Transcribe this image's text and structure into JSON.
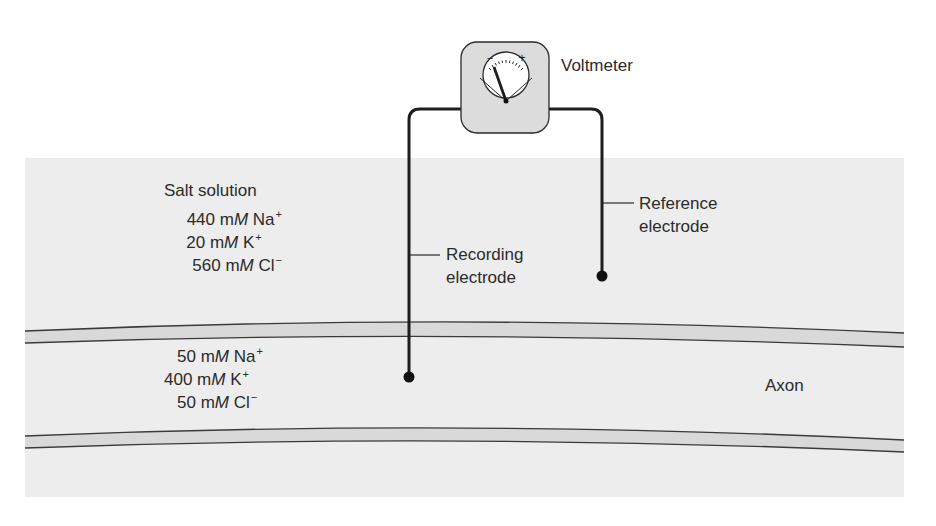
{
  "diagram": {
    "type": "experimental-setup",
    "colors": {
      "solution_bg": "#ededed",
      "membrane_fill": "#d9d9d9",
      "line": "#2a2a2a",
      "voltmeter_box": "#dcdcdc",
      "dial_face": "#ffffff"
    },
    "voltmeter": {
      "label": "Voltmeter",
      "minus_sign": "−",
      "plus_sign": "+"
    },
    "electrodes": {
      "recording": {
        "label_line1": "Recording",
        "label_line2": "electrode"
      },
      "reference": {
        "label_line1": "Reference",
        "label_line2": "electrode"
      }
    },
    "outside": {
      "title": "Salt solution",
      "ions": [
        {
          "conc": "440",
          "unit_m": "m",
          "unit_M": "M",
          "ion": "Na",
          "charge": "+"
        },
        {
          "conc": "20",
          "unit_m": "m",
          "unit_M": "M",
          "ion": "K",
          "charge": "+"
        },
        {
          "conc": "560",
          "unit_m": "m",
          "unit_M": "M",
          "ion": "Cl",
          "charge": "−"
        }
      ]
    },
    "inside": {
      "ions": [
        {
          "conc": "50",
          "unit_m": "m",
          "unit_M": "M",
          "ion": "Na",
          "charge": "+"
        },
        {
          "conc": "400",
          "unit_m": "m",
          "unit_M": "M",
          "ion": "K",
          "charge": "+"
        },
        {
          "conc": "50",
          "unit_m": "m",
          "unit_M": "M",
          "ion": "Cl",
          "charge": "−"
        }
      ]
    },
    "axon_label": "Axon"
  }
}
